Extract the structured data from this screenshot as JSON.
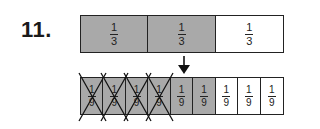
{
  "problem_number": "11.",
  "colors": {
    "shaded": "#a9a9a9",
    "unshaded": "#ffffff",
    "line": "#222222"
  },
  "top_bar": {
    "cells": [
      {
        "numerator": "1",
        "denominator": "3",
        "shaded": true
      },
      {
        "numerator": "1",
        "denominator": "3",
        "shaded": true
      },
      {
        "numerator": "1",
        "denominator": "3",
        "shaded": false
      }
    ]
  },
  "arrow": {
    "points_to": "bottom bar, cell 5",
    "icon": "down-arrow-icon"
  },
  "bottom_bar": {
    "cells": [
      {
        "numerator": "1",
        "denominator": "9",
        "shaded": true,
        "crossed_out": true
      },
      {
        "numerator": "1",
        "denominator": "9",
        "shaded": true,
        "crossed_out": true
      },
      {
        "numerator": "1",
        "denominator": "9",
        "shaded": true,
        "crossed_out": true
      },
      {
        "numerator": "1",
        "denominator": "9",
        "shaded": true,
        "crossed_out": true
      },
      {
        "numerator": "1",
        "denominator": "9",
        "shaded": true,
        "crossed_out": false
      },
      {
        "numerator": "1",
        "denominator": "9",
        "shaded": true,
        "crossed_out": false
      },
      {
        "numerator": "1",
        "denominator": "9",
        "shaded": false,
        "crossed_out": false
      },
      {
        "numerator": "1",
        "denominator": "9",
        "shaded": false,
        "crossed_out": false
      },
      {
        "numerator": "1",
        "denominator": "9",
        "shaded": false,
        "crossed_out": false
      }
    ]
  }
}
